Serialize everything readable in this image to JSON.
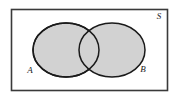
{
  "figure": {
    "kind": "venn-diagram",
    "caption": "",
    "background_color": "#ffffff",
    "universe": {
      "label": "S",
      "border_color": "#3a3a3a",
      "fill_color": "#ffffff",
      "x": 11,
      "y": 9,
      "width": 157,
      "height": 82,
      "label_x": 159,
      "label_y": 19
    },
    "sets": [
      {
        "label": "A",
        "cx": 66,
        "cy": 50,
        "rx": 33,
        "ry": 27,
        "fill_color": "#d2d2d2",
        "stroke_color": "#1a1a1a",
        "label_x": 30,
        "label_y": 73
      },
      {
        "label": "B",
        "cx": 112,
        "cy": 50,
        "rx": 33,
        "ry": 27,
        "fill_color": "#d2d2d2",
        "stroke_color": "#1a1a1a",
        "label_x": 143,
        "label_y": 72
      }
    ],
    "intersection": {
      "shaded": true,
      "fill_color": "#d2d2d2"
    }
  }
}
